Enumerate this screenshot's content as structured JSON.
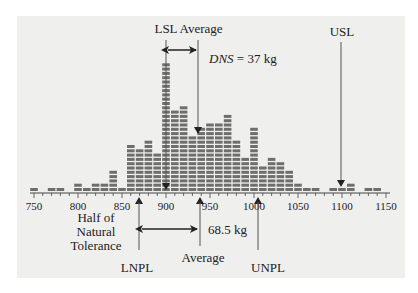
{
  "chart_data": {
    "type": "bar",
    "title": "",
    "xlabel": "",
    "ylabel": "",
    "bin_width": 10,
    "categories": [
      750,
      760,
      770,
      780,
      790,
      800,
      810,
      820,
      830,
      840,
      850,
      860,
      870,
      880,
      890,
      900,
      910,
      920,
      930,
      940,
      950,
      960,
      970,
      980,
      990,
      1000,
      1010,
      1020,
      1030,
      1040,
      1050,
      1060,
      1070,
      1080,
      1090,
      1100,
      1110,
      1120,
      1130,
      1140
    ],
    "values": [
      1,
      0,
      1,
      1,
      0,
      2,
      1,
      2,
      2,
      5,
      1,
      11,
      10,
      12,
      9,
      30,
      19,
      20,
      13,
      15,
      16,
      16,
      18,
      12,
      8,
      15,
      6,
      8,
      7,
      5,
      2,
      1,
      1,
      0,
      1,
      1,
      2,
      0,
      1,
      1
    ],
    "x_ticks": [
      750,
      800,
      850,
      900,
      950,
      1000,
      1050,
      1100,
      1150
    ],
    "xlim": [
      745,
      1155
    ],
    "grid": false,
    "bar_color": "#6e6e6e",
    "annotations": [
      {
        "text": "LSL",
        "x": 900,
        "position": "top",
        "arrow": "down"
      },
      {
        "text": "Average",
        "x": 937,
        "position": "top",
        "arrow": "down"
      },
      {
        "text": "USL",
        "x": 1100,
        "position": "top",
        "arrow": "down"
      },
      {
        "text": "DNS = 37 kg",
        "italic_part": "DNS",
        "between": [
          "LSL",
          "Average (top)"
        ]
      },
      {
        "text": "LNPL",
        "x": 868.5,
        "position": "bottom",
        "arrow": "up"
      },
      {
        "text": "Average",
        "x": 937,
        "position": "bottom",
        "arrow": "up"
      },
      {
        "text": "UNPL",
        "x": 1005.5,
        "position": "bottom",
        "arrow": "up"
      },
      {
        "text": "68.5 kg",
        "between": [
          "LNPL",
          "Average (bottom)"
        ]
      },
      {
        "text": "Half of Natural Tolerance",
        "lines": [
          "Half of",
          "Natural",
          "Tolerance"
        ]
      }
    ]
  },
  "labels": {
    "lsl": "LSL",
    "avg_top": "Average",
    "usl": "USL",
    "dns_italic": "DNS",
    "dns_rest": " = 37 kg",
    "half1": "Half of",
    "half2": "Natural",
    "half3": "Tolerance",
    "tol": "68.5 kg",
    "lnpl": "LNPL",
    "avg_bottom": "Average",
    "unpl": "UNPL"
  }
}
